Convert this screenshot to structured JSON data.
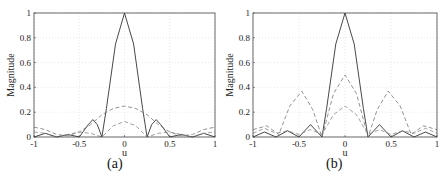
{
  "figure": {
    "captions": [
      "(a)",
      "(b)"
    ]
  },
  "chart_data": [
    {
      "type": "line",
      "panel": "(a)",
      "title": "",
      "xlabel": "u",
      "ylabel": "Magnitude",
      "xlim": [
        -1,
        1
      ],
      "ylim": [
        0,
        1
      ],
      "xticks": [
        -1,
        -0.5,
        0,
        0.5,
        1
      ],
      "xtick_labels": [
        "-1",
        "-0.5",
        "0",
        "0.5",
        "1"
      ],
      "yticks": [
        0,
        0.2,
        0.4,
        0.6,
        0.8,
        1
      ],
      "ytick_labels": [
        "0",
        "0.2",
        "0.4",
        "0.6",
        "0.8",
        "1"
      ],
      "grid": true,
      "legend": null,
      "series": [
        {
          "name": "solid",
          "style": "solid",
          "color": "#333333",
          "x": [
            -1,
            -0.875,
            -0.75,
            -0.625,
            -0.5,
            -0.4,
            -0.35,
            -0.3,
            -0.25,
            -0.2,
            -0.1,
            0,
            0.1,
            0.2,
            0.25,
            0.3,
            0.35,
            0.4,
            0.5,
            0.625,
            0.75,
            0.875,
            1
          ],
          "y": [
            0,
            0.03,
            0,
            0.02,
            0,
            0.1,
            0.14,
            0.1,
            0,
            0.23,
            0.75,
            1,
            0.75,
            0.23,
            0,
            0.1,
            0.14,
            0.1,
            0,
            0.02,
            0,
            0.03,
            0
          ]
        },
        {
          "name": "dashed-upper",
          "style": "dashed",
          "color": "#777777",
          "x": [
            -1,
            -0.875,
            -0.75,
            -0.625,
            -0.5,
            -0.375,
            -0.25,
            -0.125,
            0,
            0.125,
            0.25,
            0.375,
            0.5,
            0.625,
            0.75,
            0.875,
            1
          ],
          "y": [
            0.08,
            0.06,
            0.02,
            0.01,
            0.04,
            0.1,
            0.18,
            0.23,
            0.25,
            0.23,
            0.18,
            0.1,
            0.04,
            0.01,
            0.02,
            0.06,
            0.08
          ]
        },
        {
          "name": "dashed-lower",
          "style": "dashed",
          "color": "#888888",
          "x": [
            -1,
            -0.875,
            -0.75,
            -0.625,
            -0.5,
            -0.375,
            -0.25,
            -0.125,
            0,
            0.125,
            0.25,
            0.375,
            0.5,
            0.625,
            0.75,
            0.875,
            1
          ],
          "y": [
            0.04,
            0.03,
            0,
            0.02,
            0.04,
            0.03,
            0,
            0.09,
            0.125,
            0.09,
            0,
            0.03,
            0.04,
            0.02,
            0,
            0.03,
            0.04
          ]
        }
      ]
    },
    {
      "type": "line",
      "panel": "(b)",
      "title": "",
      "xlabel": "u",
      "ylabel": "Magnitude",
      "xlim": [
        -1,
        1
      ],
      "ylim": [
        0,
        1
      ],
      "xticks": [
        -1,
        -0.5,
        0,
        0.5,
        1
      ],
      "xtick_labels": [
        "-1",
        "-0.5",
        "0",
        "0.5",
        "1"
      ],
      "yticks": [
        0,
        0.2,
        0.4,
        0.6,
        0.8,
        1
      ],
      "ytick_labels": [
        "0",
        "0.2",
        "0.4",
        "0.6",
        "0.8",
        "1"
      ],
      "grid": true,
      "legend": null,
      "series": [
        {
          "name": "solid",
          "style": "solid",
          "color": "#333333",
          "x": [
            -1,
            -0.875,
            -0.75,
            -0.625,
            -0.5,
            -0.375,
            -0.25,
            -0.2,
            -0.1,
            0,
            0.1,
            0.2,
            0.25,
            0.375,
            0.5,
            0.625,
            0.75,
            0.875,
            1
          ],
          "y": [
            0,
            0.04,
            0,
            0.05,
            0,
            0.1,
            0,
            0.23,
            0.75,
            1,
            0.75,
            0.23,
            0,
            0.1,
            0,
            0.05,
            0,
            0.04,
            0
          ]
        },
        {
          "name": "dashed-upper",
          "style": "dashed",
          "color": "#777777",
          "x": [
            -1,
            -0.85,
            -0.72,
            -0.6,
            -0.47,
            -0.35,
            -0.25,
            -0.125,
            0,
            0.125,
            0.25,
            0.35,
            0.47,
            0.6,
            0.72,
            0.85,
            1
          ],
          "y": [
            0.06,
            0.09,
            0.02,
            0.25,
            0.37,
            0.22,
            0,
            0.35,
            0.5,
            0.35,
            0,
            0.22,
            0.37,
            0.25,
            0.02,
            0.09,
            0.06
          ]
        },
        {
          "name": "dashed-lower",
          "style": "dashed",
          "color": "#888888",
          "x": [
            -1,
            -0.875,
            -0.75,
            -0.625,
            -0.5,
            -0.375,
            -0.25,
            -0.125,
            0,
            0.125,
            0.25,
            0.375,
            0.5,
            0.625,
            0.75,
            0.875,
            1
          ],
          "y": [
            0.03,
            0.07,
            0.03,
            0.05,
            0.02,
            0.06,
            0.02,
            0.18,
            0.25,
            0.18,
            0.02,
            0.06,
            0.02,
            0.05,
            0.03,
            0.07,
            0.03
          ]
        }
      ]
    }
  ]
}
